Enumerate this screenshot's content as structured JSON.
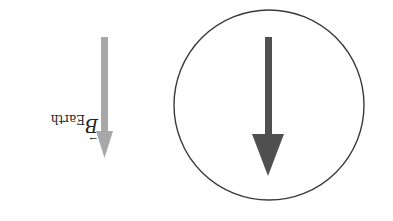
{
  "diagram": {
    "orientation": "rotated-180",
    "earth_field": {
      "label_symbol": "B",
      "label_subscript": "Earth",
      "vector_mark": "→",
      "color": "#a8a8a8"
    },
    "loop": {
      "shape": "circle",
      "stroke_color": "#3a3a3a"
    },
    "inner_arrow": {
      "color": "#505050"
    }
  }
}
